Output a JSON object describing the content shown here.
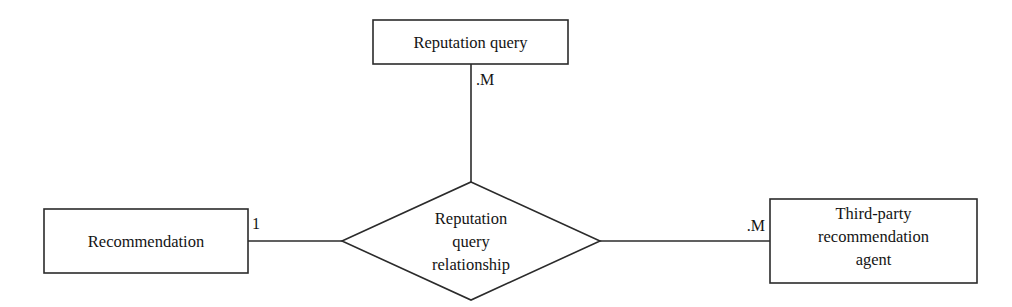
{
  "diagram": {
    "type": "entity-relationship-diagram",
    "background_color": "#ffffff",
    "line_color": "#2b2b2b",
    "text_color": "#141414",
    "entities": [
      {
        "id": "reputation-query",
        "label": "Reputation query",
        "lines": [
          "Reputation query"
        ],
        "shape": "rectangle",
        "x": 373,
        "y": 20,
        "width": 195,
        "height": 44
      },
      {
        "id": "recommendation",
        "label": "Recommendation",
        "lines": [
          "Recommendation"
        ],
        "shape": "rectangle",
        "x": 44,
        "y": 209,
        "width": 204,
        "height": 64
      },
      {
        "id": "third-party-recommendation-agent",
        "label": "Third-party recommendation agent",
        "lines": [
          "Third-party",
          "recommendation",
          "agent"
        ],
        "shape": "rectangle",
        "x": 770,
        "y": 199,
        "width": 207,
        "height": 84
      }
    ],
    "relationships": [
      {
        "id": "reputation-query-relationship",
        "label": "Reputation query relationship",
        "lines": [
          "Reputation",
          "query",
          "relationship"
        ],
        "shape": "diamond",
        "center_x": 471,
        "center_y": 241,
        "half_width": 129,
        "half_height": 59
      }
    ],
    "connectors": [
      {
        "id": "connector-reputation-query",
        "from": "reputation-query",
        "to": "reputation-query-relationship",
        "orientation": "vertical",
        "x1": 471,
        "y1": 64,
        "x2": 471,
        "y2": 182
      },
      {
        "id": "connector-recommendation",
        "from": "recommendation",
        "to": "reputation-query-relationship",
        "orientation": "horizontal",
        "x1": 248,
        "y1": 241,
        "x2": 344,
        "y2": 241
      },
      {
        "id": "connector-agent",
        "from": "reputation-query-relationship",
        "to": "third-party-recommendation-agent",
        "orientation": "horizontal",
        "x1": 598,
        "y1": 241,
        "x2": 770,
        "y2": 241
      }
    ],
    "cardinalities": [
      {
        "id": "cardinality-reputation-query",
        "text": ".M",
        "for_connector": "connector-reputation-query",
        "x": 476,
        "y": 84,
        "anchor": "start"
      },
      {
        "id": "cardinality-recommendation",
        "text": "1",
        "for_connector": "connector-recommendation",
        "x": 252,
        "y": 228,
        "anchor": "start"
      },
      {
        "id": "cardinality-agent",
        "text": ".M",
        "for_connector": "connector-agent",
        "x": 764,
        "y": 230,
        "anchor": "end"
      }
    ]
  }
}
